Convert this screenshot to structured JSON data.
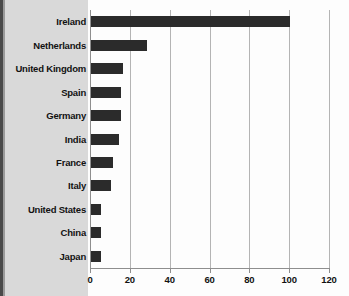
{
  "chart_data": {
    "type": "bar",
    "orientation": "horizontal",
    "title": "",
    "subtitle": "",
    "xlabel": "",
    "ylabel": "",
    "categories": [
      "Ireland",
      "Netherlands",
      "United Kingdom",
      "Spain",
      "Germany",
      "India",
      "France",
      "Italy",
      "United States",
      "China",
      "Japan"
    ],
    "values": [
      100,
      28,
      16,
      15,
      15,
      14,
      11,
      10,
      5,
      5,
      5
    ],
    "xlim": [
      0,
      120
    ],
    "xticks": [
      0,
      20,
      40,
      60,
      80,
      100,
      120
    ],
    "xtick_labels": [
      "0",
      "20",
      "40",
      "60",
      "80",
      "100",
      "120"
    ],
    "grid": true,
    "grid_axis": "x",
    "legend": false,
    "legend_position": "none",
    "bar_color": "#2b2b2b",
    "gridline_color": "#b4b4b4",
    "axis_color": "#8e8e8e",
    "label_panel_color": "#d9d9d9",
    "plot_background": "#fdfdfd"
  }
}
